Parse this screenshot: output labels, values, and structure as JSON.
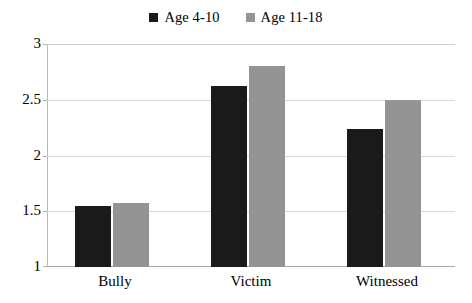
{
  "chart_data": {
    "type": "bar",
    "title": "",
    "xlabel": "",
    "ylabel": "",
    "categories": [
      "Bully",
      "Victim",
      "Witnessed"
    ],
    "series": [
      {
        "name": "Age 4-10",
        "color": "#1a1a1a",
        "values": [
          1.55,
          2.62,
          2.24
        ]
      },
      {
        "name": "Age 11-18",
        "color": "#949494",
        "values": [
          1.57,
          2.8,
          2.5
        ]
      }
    ],
    "ylim": [
      1,
      3
    ],
    "yticks": [
      "1",
      "1.5",
      "2",
      "2.5",
      "3"
    ],
    "ytick_values": [
      1,
      1.5,
      2,
      2.5,
      3
    ],
    "grid": true,
    "legend_position": "top-center"
  },
  "legend": {
    "entries": [
      {
        "label": "Age 4-10",
        "swatch": "dark-square-swatch"
      },
      {
        "label": "Age 11-18",
        "swatch": "gray-square-swatch"
      }
    ]
  },
  "colors": {
    "series_dark": "#1a1a1a",
    "series_gray": "#949494",
    "gridline": "#d9d9d9",
    "axis": "#a8a8a8",
    "background": "#ffffff",
    "text": "#000000"
  }
}
